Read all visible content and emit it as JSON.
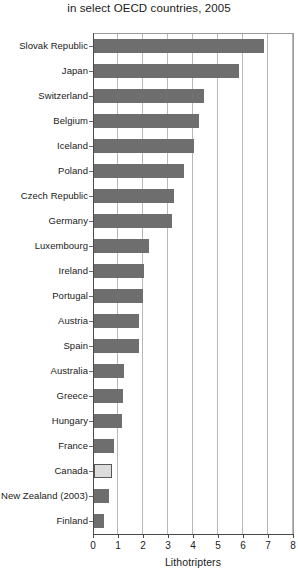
{
  "chart_data": {
    "type": "bar",
    "orientation": "horizontal",
    "title": "Lithotripters per million population,",
    "subtitle": "in select OECD countries, 2005",
    "xlabel": "Lithotripters",
    "ylabel": "",
    "xlim": [
      0,
      8
    ],
    "xticks": [
      "0",
      "1",
      "2",
      "3",
      "4",
      "5",
      "6",
      "7",
      "8"
    ],
    "grid": "vertical",
    "legend": "none",
    "bar_color": "#6e6e6e",
    "highlight_color": "#dcdcdc",
    "highlight_category": "Canada",
    "categories": [
      "Slovak Republic",
      "Japan",
      "Switzerland",
      "Belgium",
      "Iceland",
      "Poland",
      "Czech Republic",
      "Germany",
      "Luxembourg",
      "Ireland",
      "Portugal",
      "Austria",
      "Spain",
      "Australia",
      "Greece",
      "Hungary",
      "France",
      "Canada",
      "New Zealand (2003)",
      "Finland"
    ],
    "values": [
      6.8,
      5.8,
      4.4,
      4.2,
      4.0,
      3.6,
      3.2,
      3.1,
      2.2,
      2.0,
      1.95,
      1.8,
      1.8,
      1.2,
      1.15,
      1.1,
      0.8,
      0.7,
      0.6,
      0.4
    ]
  }
}
